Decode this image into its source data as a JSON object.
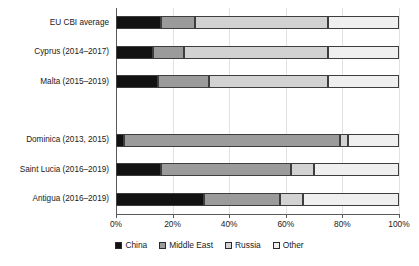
{
  "chart_data": {
    "type": "bar",
    "orientation": "horizontal",
    "stacked": true,
    "stack_mode": "percent",
    "title": "",
    "subtitle": "",
    "xlabel": "",
    "ylabel": "",
    "xlim": [
      0,
      100
    ],
    "xticks": [
      0,
      20,
      40,
      60,
      80,
      100
    ],
    "xtick_labels": [
      "0%",
      "20%",
      "40%",
      "60%",
      "80%",
      "100%"
    ],
    "grid": true,
    "grid_axis": "x",
    "legend_position": "bottom",
    "categories": [
      "EU CBI average",
      "Cyprus (2014–2017)",
      "Malta (2015–2019)",
      "",
      "Dominica (2013, 2015)",
      "Saint Lucia (2016–2019)",
      "Antigua (2016–2019)"
    ],
    "series": [
      {
        "name": "China",
        "color": "#121212",
        "values": [
          16,
          13,
          15,
          null,
          3,
          16,
          31
        ]
      },
      {
        "name": "Middle East",
        "color": "#9b9b9b",
        "values": [
          12,
          11,
          18,
          null,
          76,
          46,
          27
        ]
      },
      {
        "name": "Russia",
        "color": "#d2d2d2",
        "values": [
          47,
          51,
          42,
          null,
          3,
          8,
          8
        ]
      },
      {
        "name": "Other",
        "color": "#efefef",
        "values": [
          25,
          25,
          25,
          null,
          18,
          30,
          34
        ]
      }
    ]
  },
  "legend": {
    "items": [
      {
        "label": "China",
        "color": "#121212"
      },
      {
        "label": "Middle East",
        "color": "#9b9b9b"
      },
      {
        "label": "Russia",
        "color": "#d2d2d2"
      },
      {
        "label": "Other",
        "color": "#efefef"
      }
    ]
  }
}
